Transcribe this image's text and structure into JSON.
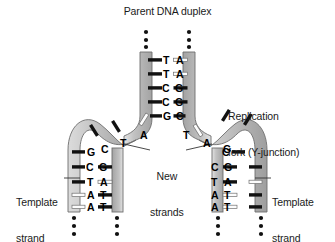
{
  "figure": {
    "title": "Parent DNA duplex",
    "kind": "dna-replication-fork-diagram",
    "labels": {
      "replication_fork_line1": "Replication",
      "replication_fork_line2": "fork (Y-junction)",
      "new_strands_line1": "New",
      "new_strands_line2": "strands",
      "template_strand_left_line1": "Template",
      "template_strand_left_line2": "strand",
      "template_strand_right_line1": "Template",
      "template_strand_right_line2": "strand"
    },
    "colors": {
      "background": "#ffffff",
      "text": "#1a1a1a",
      "strand_fill": "#b9b9b9",
      "strand_fill_light": "#d6d6d6",
      "strand_outline": "#6b6b6b",
      "rung_dark": "#111111",
      "rung_light": "#fcfcfc",
      "rung_light_outline": "#707070",
      "leader_line": "#333333",
      "dot": "#111111"
    },
    "parent_duplex_pairs": [
      {
        "left": "T",
        "right": "A"
      },
      {
        "left": "T",
        "right": "A"
      },
      {
        "left": "C",
        "right": "G"
      },
      {
        "left": "C",
        "right": "G"
      },
      {
        "left": "G",
        "right": "C"
      }
    ],
    "fork_free_bases": {
      "left_arm": [
        "C",
        "T"
      ],
      "left_arm_inner": "A",
      "right_arm_inner": "T",
      "right_arm": [
        "A",
        "G"
      ]
    },
    "left_daughter_duplex": {
      "unpaired_template_base": "G",
      "pairs": [
        {
          "left": "C",
          "right": "G"
        },
        {
          "left": "T",
          "right": "A"
        },
        {
          "left": "A",
          "right": "T"
        },
        {
          "left": "A",
          "right": "T"
        }
      ]
    },
    "right_daughter_duplex": {
      "unpaired_template_base": "C",
      "pairs": [
        {
          "left": "C",
          "right": "G"
        },
        {
          "left": "T",
          "right": "A"
        },
        {
          "left": "A",
          "right": "T"
        },
        {
          "left": "A",
          "right": "T"
        }
      ]
    },
    "ellipsis_columns_top": 2,
    "ellipsis_columns_bottom": 4
  }
}
